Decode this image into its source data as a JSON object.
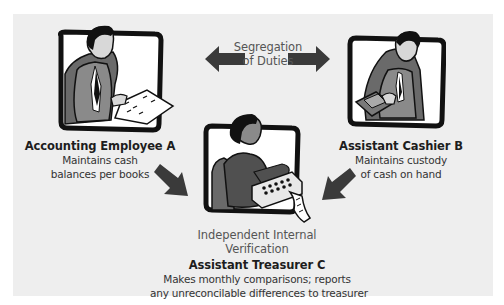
{
  "diagram": {
    "center_label": {
      "line1": "Segregation",
      "line2": "of Duties"
    },
    "bottom_label": {
      "line1": "Independent Internal",
      "line2": "Verification"
    },
    "roles": [
      {
        "title": "Accounting Employee A",
        "desc_line1": "Maintains cash",
        "desc_line2": "balances per books",
        "illustration": "man-reading-ledger"
      },
      {
        "title": "Assistant Cashier B",
        "desc_line1": "Maintains custody",
        "desc_line2": "of cash on hand",
        "illustration": "man-counting-cash"
      },
      {
        "title": "Assistant Treasurer C",
        "desc_line1": "Makes monthly comparisons; reports",
        "desc_line2": "any unreconcilable differences to treasurer",
        "illustration": "woman-adding-machine"
      }
    ],
    "arrows": [
      {
        "id": "left",
        "direction": "left"
      },
      {
        "id": "right",
        "direction": "right"
      },
      {
        "id": "down-right",
        "direction": "down-right"
      },
      {
        "id": "down-left",
        "direction": "down-left"
      }
    ],
    "colors": {
      "panel": "#eeeeee",
      "arrow": "#3a3a3a",
      "frame": "#111111",
      "suit": "#7a7a7a",
      "chair": "#5a5a5a"
    }
  }
}
